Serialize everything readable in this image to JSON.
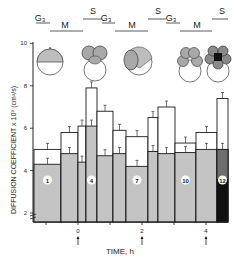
{
  "chart_data": {
    "type": "bar",
    "title": "",
    "xlabel": "TIME, h",
    "ylabel": "DIFFUSION COEFFICIENT x 10⁹ (cm²/s)",
    "ylim": [
      2,
      10
    ],
    "yticks": [
      2,
      4,
      6,
      8,
      10
    ],
    "xticks": [
      "0",
      "2",
      "4"
    ],
    "xtick_arrows": [
      0,
      2,
      4
    ],
    "phase_labels": [
      {
        "label": "G₃",
        "x": 40,
        "y": 21,
        "line": [
          36,
          50,
          23
        ]
      },
      {
        "label": "M",
        "x": 65,
        "y": 28,
        "line": [
          50,
          83,
          31
        ]
      },
      {
        "label": "S",
        "x": 93,
        "y": 14,
        "line": [
          83,
          102,
          19
        ]
      },
      {
        "label": "G₃",
        "x": 106,
        "y": 21,
        "line": [
          102,
          115,
          23
        ]
      },
      {
        "label": "M",
        "x": 132,
        "y": 28,
        "line": [
          115,
          148,
          31
        ]
      },
      {
        "label": "S",
        "x": 158,
        "y": 14,
        "line": [
          148,
          166,
          19
        ]
      },
      {
        "label": "G₃",
        "x": 171,
        "y": 21,
        "line": [
          166,
          180,
          23
        ]
      },
      {
        "label": "M",
        "x": 197,
        "y": 28,
        "line": [
          180,
          212,
          31
        ]
      },
      {
        "label": "S",
        "x": 222,
        "y": 14,
        "line": [
          212,
          228,
          19
        ]
      }
    ],
    "series": [
      {
        "name": "lower (shaded)",
        "values": [
          4.3,
          4.8,
          4.4,
          6.1,
          4.7,
          4.8,
          4.2,
          4.9,
          4.8,
          4.85,
          5.0,
          5.0
        ]
      },
      {
        "name": "upper (open)",
        "values": [
          5.0,
          5.8,
          6.1,
          7.9,
          6.8,
          5.9,
          5.6,
          6.5,
          7.0,
          5.3,
          5.8,
          7.4
        ]
      }
    ],
    "bars": [
      {
        "x0": 34,
        "x1": 61,
        "label": "1"
      },
      {
        "x0": 61,
        "x1": 78,
        "label": ""
      },
      {
        "x0": 78,
        "x1": 86,
        "label": ""
      },
      {
        "x0": 86,
        "x1": 97,
        "label": "4"
      },
      {
        "x0": 97,
        "x1": 113,
        "label": ""
      },
      {
        "x0": 113,
        "x1": 126,
        "label": ""
      },
      {
        "x0": 126,
        "x1": 148,
        "label": "7"
      },
      {
        "x0": 148,
        "x1": 158,
        "label": ""
      },
      {
        "x0": 158,
        "x1": 175,
        "label": ""
      },
      {
        "x0": 175,
        "x1": 196,
        "label": "10"
      },
      {
        "x0": 196,
        "x1": 217,
        "label": ""
      },
      {
        "x0": 217,
        "x1": 228,
        "label": "12"
      }
    ],
    "last_bar_dark_segment": {
      "bottom": 2.0,
      "mid": 3.6,
      "colors": [
        "#111111",
        "#6e6e6e"
      ]
    },
    "colors": {
      "shaded": "#c4c4c4",
      "open": "#ffffff",
      "outline": "#1a1a1a"
    }
  },
  "embryo_icons": [
    "one-cell",
    "two-cell",
    "two-cell-tilted",
    "four-cell",
    "eight-cell-dark"
  ]
}
